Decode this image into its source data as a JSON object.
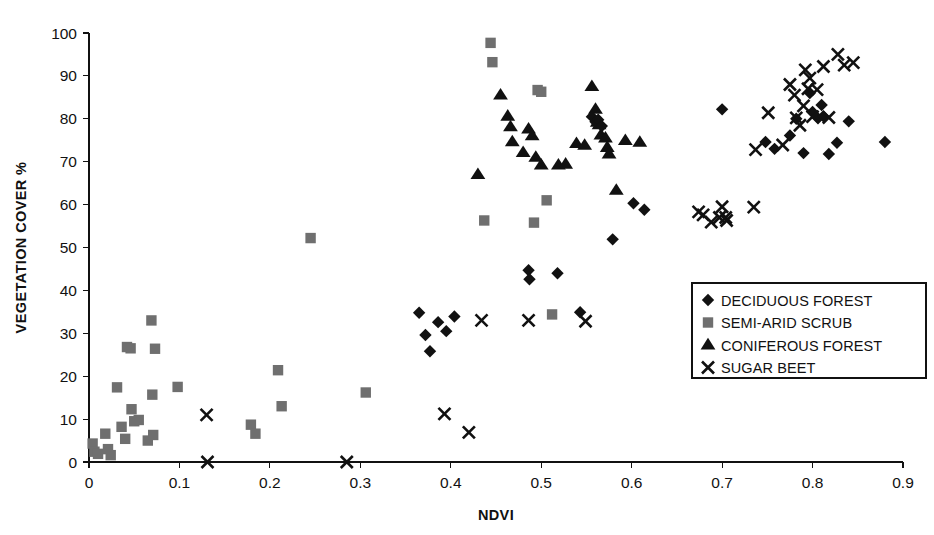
{
  "chart_data": {
    "type": "scatter",
    "title": "",
    "xlabel": "NDVI",
    "ylabel": "VEGETATION COVER %",
    "xlim": [
      0,
      0.9
    ],
    "ylim": [
      0,
      100
    ],
    "xticks": [
      0,
      0.1,
      0.2,
      0.3,
      0.4,
      0.5,
      0.6,
      0.7,
      0.8,
      0.9
    ],
    "xtick_labels": [
      "0",
      "0.1",
      "0.2",
      "0.3",
      "0.4",
      "0.5",
      "0.6",
      "0.7",
      "0.8",
      "0.9"
    ],
    "yticks": [
      0,
      10,
      20,
      30,
      40,
      50,
      60,
      70,
      80,
      90,
      100
    ],
    "ytick_labels": [
      "0",
      "10",
      "20",
      "30",
      "40",
      "50",
      "60",
      "70",
      "80",
      "90",
      "100"
    ],
    "grid": false,
    "legend_position": "lower-right",
    "series": [
      {
        "name": "DECIDUOUS FOREST",
        "marker": "diamond",
        "color": "#111111",
        "points": [
          [
            0.365,
            34.8
          ],
          [
            0.372,
            29.6
          ],
          [
            0.377,
            25.8
          ],
          [
            0.386,
            32.6
          ],
          [
            0.395,
            30.5
          ],
          [
            0.404,
            33.9
          ],
          [
            0.486,
            44.7
          ],
          [
            0.487,
            42.6
          ],
          [
            0.518,
            44.0
          ],
          [
            0.543,
            34.9
          ],
          [
            0.556,
            80.5
          ],
          [
            0.56,
            79.3
          ],
          [
            0.563,
            79.8
          ],
          [
            0.567,
            78.3
          ],
          [
            0.579,
            51.9
          ],
          [
            0.602,
            60.3
          ],
          [
            0.614,
            58.8
          ],
          [
            0.7,
            82.2
          ],
          [
            0.748,
            74.6
          ],
          [
            0.758,
            73.0
          ],
          [
            0.775,
            76.1
          ],
          [
            0.782,
            80.0
          ],
          [
            0.79,
            72.0
          ],
          [
            0.797,
            86.0
          ],
          [
            0.8,
            81.6
          ],
          [
            0.806,
            80.1
          ],
          [
            0.81,
            83.2
          ],
          [
            0.812,
            80.6
          ],
          [
            0.818,
            71.8
          ],
          [
            0.827,
            74.4
          ],
          [
            0.84,
            79.4
          ],
          [
            0.88,
            74.6
          ]
        ]
      },
      {
        "name": "SEMI-ARID SCRUB",
        "marker": "square",
        "color": "#6f6f6f",
        "points": [
          [
            0.004,
            4.3
          ],
          [
            0.006,
            2.4
          ],
          [
            0.01,
            1.9
          ],
          [
            0.018,
            6.6
          ],
          [
            0.021,
            3.0
          ],
          [
            0.024,
            1.6
          ],
          [
            0.031,
            17.4
          ],
          [
            0.036,
            8.2
          ],
          [
            0.04,
            5.4
          ],
          [
            0.042,
            26.8
          ],
          [
            0.046,
            26.5
          ],
          [
            0.047,
            12.3
          ],
          [
            0.05,
            9.5
          ],
          [
            0.055,
            9.8
          ],
          [
            0.065,
            5.0
          ],
          [
            0.069,
            33.0
          ],
          [
            0.07,
            15.7
          ],
          [
            0.071,
            6.3
          ],
          [
            0.073,
            26.4
          ],
          [
            0.098,
            17.5
          ],
          [
            0.179,
            8.7
          ],
          [
            0.184,
            6.6
          ],
          [
            0.209,
            21.4
          ],
          [
            0.213,
            13.0
          ],
          [
            0.245,
            52.2
          ],
          [
            0.306,
            16.2
          ],
          [
            0.437,
            56.3
          ],
          [
            0.444,
            97.7
          ],
          [
            0.446,
            93.2
          ],
          [
            0.492,
            55.8
          ],
          [
            0.496,
            86.7
          ],
          [
            0.5,
            86.3
          ],
          [
            0.506,
            61.0
          ],
          [
            0.512,
            34.4
          ]
        ]
      },
      {
        "name": "CONIFEROUS FOREST",
        "marker": "triangle",
        "color": "#111111",
        "points": [
          [
            0.43,
            67.0
          ],
          [
            0.455,
            85.5
          ],
          [
            0.463,
            80.6
          ],
          [
            0.466,
            78.1
          ],
          [
            0.468,
            74.6
          ],
          [
            0.48,
            72.1
          ],
          [
            0.486,
            77.6
          ],
          [
            0.49,
            76.0
          ],
          [
            0.494,
            71.0
          ],
          [
            0.5,
            69.2
          ],
          [
            0.519,
            69.2
          ],
          [
            0.527,
            69.4
          ],
          [
            0.539,
            74.2
          ],
          [
            0.548,
            73.8
          ],
          [
            0.556,
            87.5
          ],
          [
            0.56,
            82.2
          ],
          [
            0.562,
            79.2
          ],
          [
            0.564,
            78.6
          ],
          [
            0.566,
            76.2
          ],
          [
            0.571,
            75.5
          ],
          [
            0.573,
            73.3
          ],
          [
            0.575,
            71.8
          ],
          [
            0.583,
            63.3
          ],
          [
            0.593,
            74.9
          ],
          [
            0.609,
            74.5
          ]
        ]
      },
      {
        "name": "SUGAR BEET",
        "marker": "cross",
        "color": "#111111",
        "points": [
          [
            0.13,
            11.0
          ],
          [
            0.131,
            0.0
          ],
          [
            0.285,
            0.0
          ],
          [
            0.393,
            11.2
          ],
          [
            0.42,
            6.9
          ],
          [
            0.434,
            33.0
          ],
          [
            0.486,
            33.0
          ],
          [
            0.549,
            32.8
          ],
          [
            0.674,
            58.3
          ],
          [
            0.679,
            57.6
          ],
          [
            0.688,
            55.9
          ],
          [
            0.697,
            57.0
          ],
          [
            0.7,
            59.5
          ],
          [
            0.704,
            57.0
          ],
          [
            0.705,
            56.3
          ],
          [
            0.735,
            59.4
          ],
          [
            0.737,
            72.8
          ],
          [
            0.751,
            81.4
          ],
          [
            0.767,
            73.9
          ],
          [
            0.775,
            88.0
          ],
          [
            0.78,
            85.5
          ],
          [
            0.782,
            80.2
          ],
          [
            0.786,
            78.5
          ],
          [
            0.79,
            83.0
          ],
          [
            0.792,
            91.4
          ],
          [
            0.795,
            87.0
          ],
          [
            0.797,
            89.5
          ],
          [
            0.8,
            80.5
          ],
          [
            0.805,
            86.8
          ],
          [
            0.812,
            92.2
          ],
          [
            0.818,
            80.3
          ],
          [
            0.828,
            95.0
          ],
          [
            0.835,
            92.5
          ],
          [
            0.845,
            93.1
          ]
        ]
      }
    ]
  },
  "legend": {
    "entries": [
      {
        "label": "DECIDUOUS FOREST",
        "marker": "diamond"
      },
      {
        "label": "SEMI-ARID SCRUB",
        "marker": "square"
      },
      {
        "label": "CONIFEROUS FOREST",
        "marker": "triangle"
      },
      {
        "label": "SUGAR BEET",
        "marker": "cross"
      }
    ]
  }
}
